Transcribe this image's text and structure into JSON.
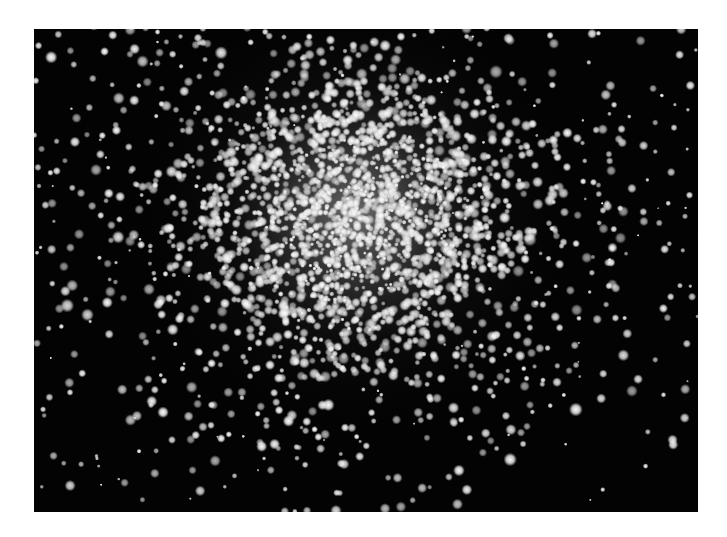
{
  "image": {
    "subject": "Globular star cluster",
    "background_color": "#030303",
    "page_background": "#ffffff",
    "frame": {
      "x": 34,
      "y": 29,
      "width": 664,
      "height": 483
    },
    "cluster": {
      "center_x": 322,
      "center_y": 185,
      "core_radius": 95,
      "halo_radius": 230,
      "core_glow_color": "#bdbdbd",
      "star_count": 2600,
      "seed": 42
    },
    "field": {
      "star_count": 260,
      "seed": 7
    },
    "star_color": "#f4f4f4"
  }
}
